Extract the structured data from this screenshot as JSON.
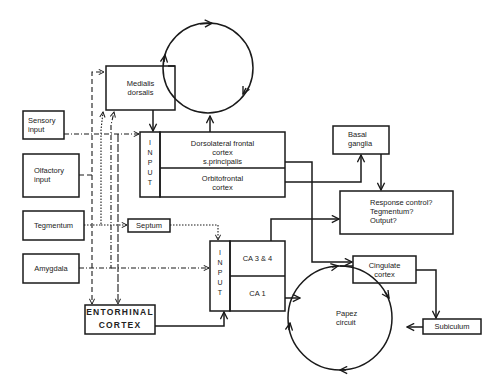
{
  "diagram": {
    "nodes": {
      "medialis_dorsalis": "Medialis\ndorsalis",
      "sensory_input": "Sensory\ninput",
      "olfactory_input": "Olfactory\ninput",
      "tegmentum": "Tegmentum",
      "amygdala": "Amygdala",
      "septum": "Septum",
      "entorhinal_cortex": "ENTORHINAL\nCORTEX",
      "frontal_input": "INPUT",
      "dorsolateral": "Dorsolateral frontal\ncortex\ns.principalis",
      "orbitofrontal": "Orbitofrontal\ncortex",
      "basal_ganglia": "Basal\nganglia",
      "response_control": "Response control?\nTegmentum?\nOutput?",
      "hippocampal_input": "INPUT",
      "ca34": "CA 3 & 4",
      "ca1": "CA 1",
      "cingulate": "Cingulate\ncortex",
      "papez": "Papez\ncircuit",
      "subiculum": "Subiculum"
    },
    "colors": {
      "line": "#1a1a1a",
      "background": "#ffffff"
    }
  }
}
